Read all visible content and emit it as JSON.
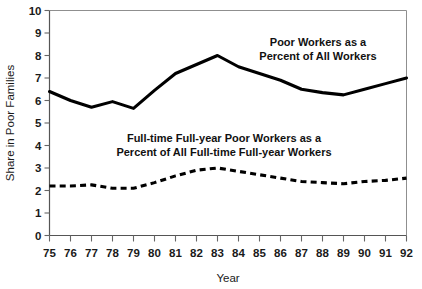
{
  "chart_data": {
    "type": "line",
    "title": "",
    "title_clipped_note": "",
    "xlabel": "Year",
    "ylabel": "Share in Poor Families",
    "categories": [
      "75",
      "76",
      "77",
      "78",
      "79",
      "80",
      "81",
      "82",
      "83",
      "84",
      "85",
      "86",
      "87",
      "88",
      "89",
      "90",
      "91",
      "92"
    ],
    "xlim": [
      75,
      92
    ],
    "ylim": [
      0,
      10
    ],
    "yticks": [
      "0",
      "1",
      "2",
      "3",
      "4",
      "5",
      "6",
      "7",
      "8",
      "9",
      "10"
    ],
    "grid": false,
    "legend_position": "inline-annotations",
    "series": [
      {
        "name": "Poor Workers as a Percent of All Workers",
        "style": "solid",
        "color": "#000000",
        "values": [
          6.4,
          6.0,
          5.7,
          5.95,
          5.65,
          6.45,
          7.2,
          7.6,
          8.0,
          7.5,
          7.2,
          6.9,
          6.5,
          6.35,
          6.25,
          6.5,
          6.75,
          7.0
        ]
      },
      {
        "name": "Full-time Full-year Poor Workers as a Percent of All Full-time Full-year Workers",
        "style": "dashed",
        "color": "#000000",
        "values": [
          2.2,
          2.2,
          2.25,
          2.1,
          2.1,
          2.35,
          2.65,
          2.9,
          3.0,
          2.85,
          2.7,
          2.55,
          2.4,
          2.35,
          2.3,
          2.4,
          2.45,
          2.55
        ]
      }
    ],
    "annotations": [
      {
        "id": "annotation-solid",
        "lines": [
          "Poor Workers as a",
          "Percent of All Workers"
        ],
        "x_px": 318,
        "y_px": 46
      },
      {
        "id": "annotation-dashed",
        "lines": [
          "Full-time Full-year Poor Workers as a",
          "Percent of All Full-time Full-year Workers"
        ],
        "x_px": 224,
        "y_px": 142
      }
    ]
  },
  "figure": {
    "background": "#ffffff",
    "axis_color": "#555555",
    "frame_color": "#8f8f8f",
    "text_color": "#1a1a1a"
  }
}
